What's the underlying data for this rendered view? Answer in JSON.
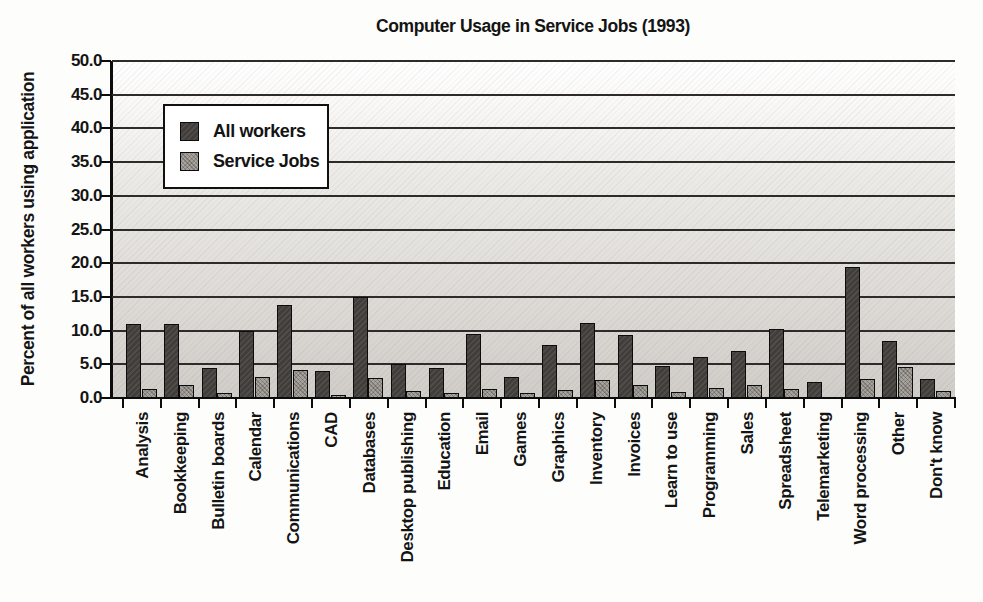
{
  "title": "Computer Usage in Service Jobs (1993)",
  "colors": {
    "all_workers_bar": "#413d3a",
    "service_jobs_bar": "#a8a39d",
    "gridline": "#2e2c2a",
    "axis": "#0c0c0c",
    "plot_background_top": "#ffffff",
    "plot_background_bottom": "#d0cdc9"
  },
  "chart_data": {
    "type": "bar",
    "title": "Computer Usage in Service Jobs (1993)",
    "xlabel": "",
    "ylabel": "Percent of all workers using application",
    "ylim": [
      0,
      50
    ],
    "ytick_step": 5,
    "ytick_labels": [
      "0.0",
      "5.0",
      "10.0",
      "15.0",
      "20.0",
      "25.0",
      "30.0",
      "35.0",
      "40.0",
      "45.0",
      "50.0"
    ],
    "grid": true,
    "legend_position": "top-left-inside",
    "categories": [
      "Analysis",
      "Bookkeeping",
      "Bulletin boards",
      "Calendar",
      "Communications",
      "CAD",
      "Databases",
      "Desktop publishing",
      "Education",
      "Email",
      "Games",
      "Graphics",
      "Inventory",
      "Invoices",
      "Learn to use",
      "Programming",
      "Sales",
      "Spreadsheet",
      "Telemarketing",
      "Word processing",
      "Other",
      "Don't know"
    ],
    "series": [
      {
        "name": "All workers",
        "values": [
          11.0,
          11.0,
          4.4,
          10.0,
          13.8,
          4.0,
          15.0,
          5.0,
          4.4,
          9.5,
          3.1,
          7.8,
          11.1,
          9.3,
          4.7,
          6.1,
          6.9,
          10.3,
          2.4,
          19.5,
          8.5,
          2.8
        ]
      },
      {
        "name": "Service Jobs",
        "values": [
          1.3,
          2.0,
          0.8,
          3.1,
          4.2,
          0.4,
          3.0,
          1.1,
          0.7,
          1.4,
          0.7,
          1.2,
          2.7,
          2.0,
          0.9,
          1.5,
          2.0,
          1.4,
          0.0,
          2.8,
          4.6,
          1.1
        ]
      }
    ]
  }
}
